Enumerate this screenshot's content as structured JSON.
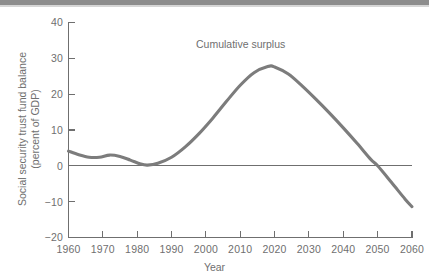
{
  "figure": {
    "background_color": "#ffffff",
    "ink_color": "#6f6f6f",
    "series_color": "#7c7c7c",
    "top_bar_color": "#8d8d8d"
  },
  "chart_data": {
    "type": "line",
    "title": "",
    "subtitle": "",
    "xlabel": "Year",
    "ylabel": "Social security trust fund balance (percent of GDP)",
    "ylabel_lines": [
      "Social security trust fund balance",
      "(percent of GDP)"
    ],
    "xlim": [
      1960,
      2060
    ],
    "ylim": [
      -20,
      40
    ],
    "xticks": [
      1960,
      1970,
      1980,
      1990,
      2000,
      2010,
      2020,
      2030,
      2040,
      2050,
      2060
    ],
    "xtick_labels": [
      "1960",
      "1970",
      "1980",
      "1990",
      "2000",
      "2010",
      "2020",
      "2030",
      "2040",
      "2050",
      "2060"
    ],
    "yticks": [
      -20,
      -10,
      0,
      10,
      20,
      30,
      40
    ],
    "ytick_labels": [
      "−20",
      "−10",
      "0",
      "10",
      "20",
      "30",
      "40"
    ],
    "grid": false,
    "legend": "none",
    "zero_reference_line": 0,
    "annotations": [
      {
        "text": "Cumulative surplus",
        "x": 2007,
        "y": 31
      }
    ],
    "series": [
      {
        "name": "Cumulative surplus",
        "color": "#7c7c7c",
        "x": [
          1960,
          1963,
          1966,
          1969,
          1972,
          1975,
          1978,
          1981,
          1983,
          1986,
          1990,
          1994,
          1998,
          2002,
          2006,
          2010,
          2014,
          2018,
          2020,
          2024,
          2028,
          2032,
          2036,
          2040,
          2044,
          2048,
          2050,
          2054,
          2058,
          2060
        ],
        "y": [
          4.1,
          3.1,
          2.4,
          2.4,
          3.0,
          2.6,
          1.6,
          0.5,
          0.2,
          0.7,
          2.4,
          5.3,
          9.0,
          13.3,
          18.0,
          22.5,
          26.0,
          27.7,
          27.6,
          25.6,
          22.3,
          18.6,
          14.7,
          10.6,
          6.3,
          1.8,
          0.0,
          -4.6,
          -9.3,
          -11.4
        ]
      }
    ],
    "notable_points": {
      "start_1960": 4.1,
      "local_bump_1972": 3.0,
      "trough_1983": 0.2,
      "peak_year": 2019,
      "peak_value": 27.8,
      "zero_crossing_year": 2050,
      "end_2060": -11.4
    }
  }
}
